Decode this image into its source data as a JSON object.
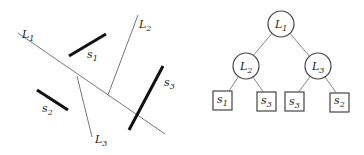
{
  "left_figure": {
    "lines": [
      {
        "label": "L",
        "sub": "1"
      },
      {
        "label": "L",
        "sub": "2"
      },
      {
        "label": "L",
        "sub": "3"
      }
    ],
    "segments": [
      {
        "label": "s",
        "sub": "1"
      },
      {
        "label": "s",
        "sub": "2"
      },
      {
        "label": "s",
        "sub": "3"
      }
    ]
  },
  "tree": {
    "root": {
      "label": "L",
      "sub": "1"
    },
    "internal": [
      {
        "label": "L",
        "sub": "2"
      },
      {
        "label": "L",
        "sub": "3"
      }
    ],
    "leaves": [
      {
        "label": "s",
        "sub": "1"
      },
      {
        "label": "s",
        "sub": "3"
      },
      {
        "label": "s",
        "sub": "3"
      },
      {
        "label": "s",
        "sub": "2"
      }
    ]
  }
}
